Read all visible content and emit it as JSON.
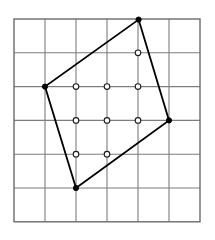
{
  "figure": {
    "canvas": {
      "width": 215,
      "height": 240
    },
    "background_color": "#ffffff"
  },
  "grid": {
    "name": "square-lattice-grid",
    "columns": 6,
    "rows": 6,
    "cell_width": 31,
    "cell_height": 33.8,
    "origin_x": 14,
    "origin_y": 19,
    "line_color": "#7d7d7d",
    "line_width": 1.1,
    "border_color": "#6b6b6b",
    "border_width": 1.4,
    "x_line_positions": [
      14,
      45,
      76,
      107,
      138,
      169,
      200
    ],
    "y_line_positions": [
      19,
      52.8,
      86.6,
      120.4,
      154.2,
      188,
      221.8
    ]
  },
  "chart_data": {
    "type": "scatter",
    "xlabel": "",
    "ylabel": "",
    "xlim": [
      0,
      6
    ],
    "ylim": [
      0,
      6
    ],
    "grid": true,
    "legend": "none",
    "polygon": {
      "name": "quadrilateral",
      "closed": true,
      "stroke_color": "#000000",
      "stroke_width": 1.8,
      "fill": "none",
      "lattice_vertices": [
        {
          "label": "top",
          "col": 4,
          "row": 0,
          "px": 138.6,
          "py": 19.6
        },
        {
          "label": "right",
          "col": 5,
          "row": 3,
          "px": 169.0,
          "py": 120.4
        },
        {
          "label": "bottom",
          "col": 2,
          "row": 5,
          "px": 76.0,
          "py": 188.0
        },
        {
          "label": "left",
          "col": 1,
          "row": 2,
          "px": 45.0,
          "py": 86.6
        }
      ],
      "vertex_marker": {
        "style": "filled-dot",
        "radius": 2.6,
        "fill_color": "#000000",
        "stroke_color": "#000000"
      }
    },
    "interior_points": {
      "name": "interior-lattice-points",
      "count": 9,
      "marker": {
        "style": "open-circle",
        "radius": 2.8,
        "fill_color": "#ffffff",
        "stroke_color": "#1a1a1a",
        "stroke_width": 1.1
      },
      "points": [
        {
          "col": 4,
          "row": 1,
          "px": 138.0,
          "py": 52.8
        },
        {
          "col": 2,
          "row": 2,
          "px": 76.0,
          "py": 86.6
        },
        {
          "col": 3,
          "row": 2,
          "px": 107.0,
          "py": 86.6
        },
        {
          "col": 4,
          "row": 2,
          "px": 138.0,
          "py": 86.6
        },
        {
          "col": 2,
          "row": 3,
          "px": 76.0,
          "py": 120.4
        },
        {
          "col": 3,
          "row": 3,
          "px": 107.0,
          "py": 120.4
        },
        {
          "col": 4,
          "row": 3,
          "px": 138.0,
          "py": 120.4
        },
        {
          "col": 2,
          "row": 4,
          "px": 76.0,
          "py": 154.2
        },
        {
          "col": 3,
          "row": 4,
          "px": 107.0,
          "py": 154.2
        }
      ]
    }
  }
}
